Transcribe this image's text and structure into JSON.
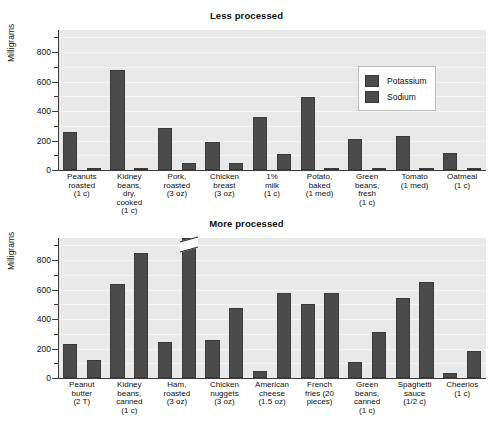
{
  "figure": {
    "ylabel": "Milligrams",
    "legend": [
      {
        "name": "potassium",
        "label": "Potassium",
        "color": "#4b4b4b"
      },
      {
        "name": "sodium",
        "label": "Sodium",
        "color": "#4b4b4b"
      }
    ]
  },
  "chart_data": [
    {
      "type": "bar",
      "title": "Less processed",
      "xlabel": "",
      "ylabel": "Milligrams",
      "ylim": [
        0,
        950
      ],
      "yticks": [
        0,
        200,
        400,
        600,
        800
      ],
      "yticklabels": [
        "0",
        "200",
        "400",
        "600",
        "800"
      ],
      "minor_tick_step": 100,
      "grid": true,
      "legend_position": "upper-right",
      "categories": [
        "Peanuts\nroasted\n(1 c)",
        "Kidney\nbeans,\ndry,\ncooked\n(1 c)",
        "Pork,\nroasted\n(3 oz)",
        "Chicken\nbreast\n(3 oz)",
        "1%\nmilk\n(1 c)",
        "Potato,\nbaked\n(1 med)",
        "Green\nbeans,\nfresh\n(1 c)",
        "Tomato\n(1 med)",
        "Oatmeal\n(1 c)"
      ],
      "series": [
        {
          "name": "Potassium",
          "values": [
            260,
            680,
            285,
            190,
            360,
            495,
            210,
            230,
            115
          ]
        },
        {
          "name": "Sodium",
          "values": [
            10,
            10,
            45,
            48,
            110,
            12,
            12,
            10,
            10
          ]
        }
      ]
    },
    {
      "type": "bar",
      "title": "More processed",
      "xlabel": "",
      "ylabel": "Milligrams",
      "ylim": [
        0,
        950
      ],
      "yticks": [
        0,
        200,
        400,
        600,
        800
      ],
      "yticklabels": [
        "0",
        "200",
        "400",
        "600",
        "800"
      ],
      "minor_tick_step": 100,
      "grid": true,
      "legend_position": "none",
      "categories": [
        "Peanut\nbutter\n(2 T)",
        "Kidney\nbeans,\ncanned\n(1 c)",
        "Ham,\nroasted\n(3 oz)",
        "Chicken\nnuggets\n(3 oz)",
        "American\ncheese\n(1.5 oz)",
        "French\nfries (20\npieces)",
        "Green\nbeans,\ncanned\n(1 c)",
        "Spaghetti\nsauce\n(1/2 c)",
        "Cheerios\n(1 c)"
      ],
      "series": [
        {
          "name": "Potassium",
          "values": [
            230,
            640,
            245,
            260,
            45,
            505,
            110,
            540,
            35
          ]
        },
        {
          "name": "Sodium",
          "values": [
            125,
            845,
            950,
            475,
            575,
            575,
            310,
            650,
            180
          ]
        }
      ],
      "annotations": [
        {
          "name": "axis-break",
          "series": "Sodium",
          "category_index": 2,
          "note": "bar exceeds axis maximum"
        }
      ]
    }
  ]
}
